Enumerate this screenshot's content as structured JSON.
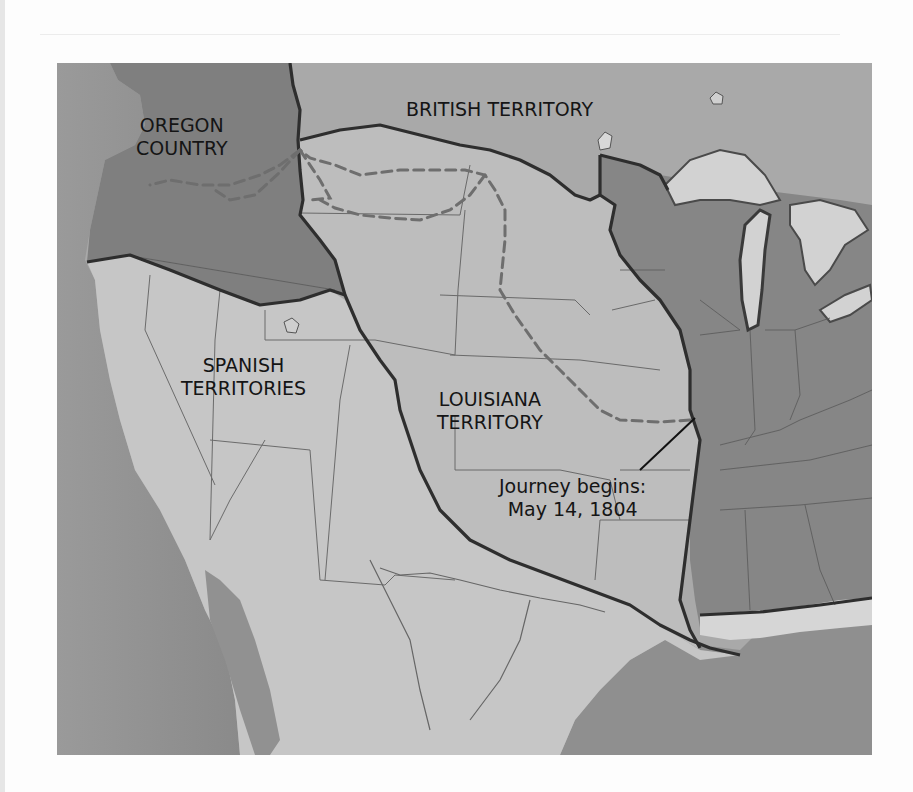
{
  "map": {
    "title": "Lewis and Clark Expedition Map",
    "labels": {
      "oregon_line1": "OREGON",
      "oregon_line2": "COUNTRY",
      "british": "BRITISH TERRITORY",
      "spanish_line1": "SPANISH",
      "spanish_line2": "TERRITORIES",
      "louisiana_line1": "LOUISIANA",
      "louisiana_line2": "TERRITORY",
      "journey_line1": "Journey begins:",
      "journey_line2": "May 14, 1804"
    },
    "regions": [
      {
        "name": "Oregon Country",
        "color": "#7f7f7f"
      },
      {
        "name": "British Territory",
        "color": "#a9a9a9"
      },
      {
        "name": "Spanish Territories",
        "color": "#c6c6c6"
      },
      {
        "name": "Louisiana Territory",
        "color": "#bdbdbd"
      },
      {
        "name": "United States",
        "color": "#868686"
      },
      {
        "name": "Pacific Ocean",
        "color": "#8d8d8d"
      },
      {
        "name": "Gulf of Mexico",
        "color": "#8f8f8f"
      },
      {
        "name": "Great Lakes",
        "color": "#d2d2d2"
      }
    ],
    "route": {
      "style": "dashed",
      "color": "#777777"
    },
    "annotation": {
      "type": "leader-line",
      "from": "journey-label",
      "to": "St. Louis start point"
    }
  }
}
